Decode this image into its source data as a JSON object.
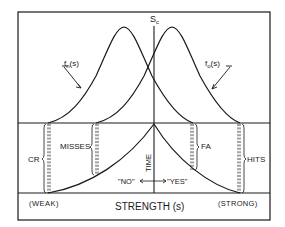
{
  "diagram": {
    "threshold_label": "S",
    "threshold_subscript": "c",
    "noise_curve_label": "f",
    "noise_curve_subscript": "n",
    "noise_curve_arg": "(s)",
    "signal_curve_label": "f",
    "signal_curve_subscript": "o",
    "signal_curve_arg": "(s)",
    "regions": {
      "cr": "CR",
      "misses": "MISSES",
      "fa": "FA",
      "hits": "HITS"
    },
    "time_axis_label": "TIME",
    "response_no": "\"NO\"",
    "response_yes": "\"YES\"",
    "x_axis_label": "STRENGTH (s)",
    "x_axis_left": "(WEAK)",
    "x_axis_right": "(STRONG)",
    "colors": {
      "ink": "#1a1a1a",
      "background": "#ffffff"
    }
  }
}
